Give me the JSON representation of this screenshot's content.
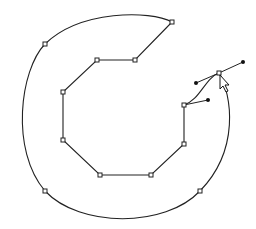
{
  "canvas": {
    "width": 256,
    "height": 229,
    "background": "#ffffff",
    "stroke_color": "#222222"
  },
  "path": {
    "shape": "open curved ring (C-shape) drawn with bezier pen tool",
    "outer_arc": {
      "start": [
        172,
        22
      ],
      "top_extreme": [
        120,
        13
      ],
      "left_anchor_upper": [
        45,
        44
      ],
      "left_extreme": [
        17,
        118
      ],
      "left_anchor_lower": [
        45,
        191
      ],
      "bottom_extreme": [
        125,
        221
      ],
      "right_anchor_lower": [
        200,
        191
      ],
      "right_extreme": [
        233,
        130
      ],
      "end": [
        219,
        73
      ]
    },
    "inner_octagon_anchors": [
      [
        172,
        22
      ],
      [
        135,
        60
      ],
      [
        97,
        60
      ],
      [
        63,
        92
      ],
      [
        63,
        140
      ],
      [
        100,
        175
      ],
      [
        151,
        175
      ],
      [
        184,
        144
      ],
      [
        184,
        105
      ]
    ],
    "selected_anchor": {
      "point": [
        219,
        73
      ],
      "handle_in": [
        196,
        83
      ],
      "handle_out": [
        243,
        62
      ]
    },
    "previous_anchor_handle": {
      "point": [
        184,
        105
      ],
      "handle_out": [
        208,
        100
      ]
    }
  },
  "cursor": {
    "type": "arrow-pointer",
    "position": [
      220,
      75
    ]
  }
}
